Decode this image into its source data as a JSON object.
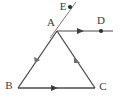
{
  "figure": {
    "background_color": "#ffffff",
    "stroke_color": "#4a4a4a",
    "label_color": "#3a3a3a",
    "labels": {
      "A": "A",
      "B": "B",
      "C": "C",
      "D": "D",
      "E": "E"
    },
    "points": {
      "A": {
        "x": 57,
        "y": 31
      },
      "B": {
        "x": 18,
        "y": 88
      },
      "C": {
        "x": 95,
        "y": 88
      },
      "D": {
        "x": 101,
        "y": 31
      },
      "E": {
        "x": 70,
        "y": 7
      }
    },
    "label_positions": {
      "A": {
        "x": 51,
        "y": 23
      },
      "B": {
        "x": 9,
        "y": 86
      },
      "C": {
        "x": 102,
        "y": 87
      },
      "D": {
        "x": 101,
        "y": 22
      },
      "E": {
        "x": 63,
        "y": 7
      }
    },
    "segments": [
      {
        "name": "side-ab",
        "from": "A",
        "to": "B"
      },
      {
        "name": "side-ac",
        "from": "A",
        "to": "C"
      },
      {
        "name": "side-bc",
        "from": "B",
        "to": "C"
      }
    ],
    "rays": [
      {
        "name": "ray-ad",
        "from": "A",
        "to": "D",
        "extends_to_x": 113
      },
      {
        "name": "line-ae",
        "from": "A",
        "to": "E",
        "extends_to_x": 76
      }
    ],
    "markers": {
      "bc_direction_arrow": {
        "x": 55,
        "y": 88
      },
      "ad_direction_arrow": {
        "x": 81,
        "y": 31
      },
      "ab_tick": {
        "x": 37,
        "y": 60
      },
      "ac_tick": {
        "x": 77,
        "y": 61
      }
    },
    "dots": [
      {
        "name": "point-d-dot",
        "x": 101,
        "y": 31
      },
      {
        "name": "point-e-dot",
        "x": 70,
        "y": 7
      }
    ]
  }
}
